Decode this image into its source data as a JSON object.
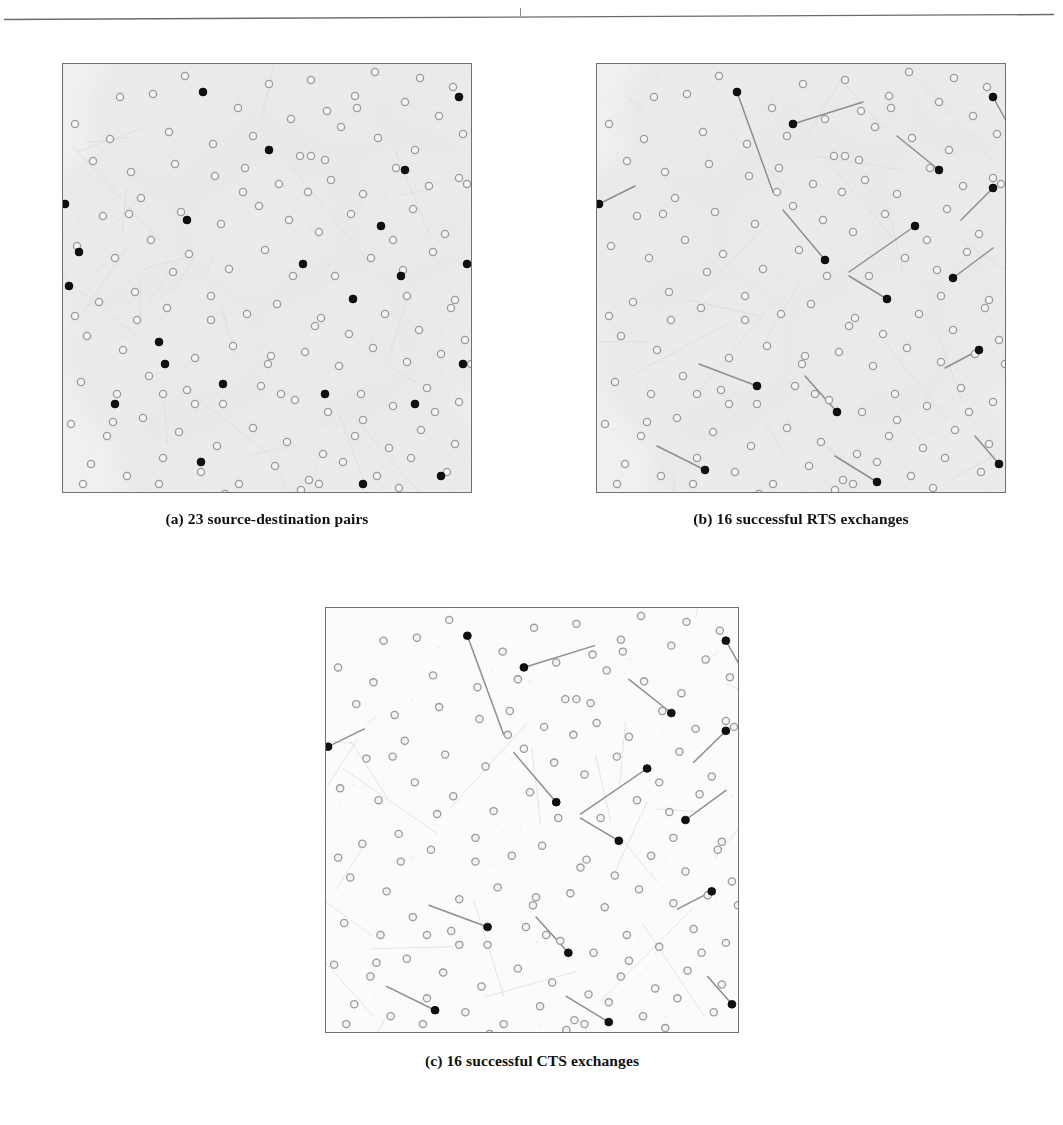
{
  "figure": {
    "header_rule": "horizontal-rule",
    "panels": [
      {
        "id": "a",
        "caption": "(a) 23 source-destination pairs",
        "label": "a",
        "background_shading": true,
        "links_drawn": false
      },
      {
        "id": "b",
        "caption": "(b) 16 successful RTS exchanges",
        "label": "b",
        "background_shading": true,
        "links_drawn": true
      },
      {
        "id": "c",
        "caption": "(c) 16 successful CTS exchanges",
        "label": "c",
        "background_shading": false,
        "links_drawn": true
      }
    ]
  },
  "colors": {
    "node_idle_stroke": "#9a9a9a",
    "node_idle_fill": "#f4f4f4",
    "node_active_fill": "#111111",
    "link_stroke": "#8e8e8e",
    "panel_border": "#70706e",
    "cell_shading": "#e8e8e8",
    "caption_text": "#111111",
    "page_background": "#ffffff"
  },
  "chart_data": {
    "type": "scatter",
    "title": "",
    "xlabel": "",
    "ylabel": "",
    "xlim": [
      0,
      410
    ],
    "ylim": [
      0,
      430
    ],
    "grid": false,
    "legend": null,
    "node_counts": {
      "total_nodes": 150,
      "active_nodes_panel_a": 23,
      "active_nodes_panel_b": 16,
      "active_nodes_panel_c": 16
    },
    "nodes": [
      [
        122,
        12
      ],
      [
        206,
        20
      ],
      [
        248,
        16
      ],
      [
        292,
        32
      ],
      [
        312,
        8
      ],
      [
        357,
        14
      ],
      [
        390,
        23
      ],
      [
        57,
        33
      ],
      [
        90,
        30
      ],
      [
        140,
        28
      ],
      [
        175,
        44
      ],
      [
        228,
        55
      ],
      [
        264,
        47
      ],
      [
        294,
        44
      ],
      [
        342,
        38
      ],
      [
        376,
        52
      ],
      [
        12,
        60
      ],
      [
        47,
        75
      ],
      [
        106,
        68
      ],
      [
        150,
        80
      ],
      [
        190,
        72
      ],
      [
        237,
        92
      ],
      [
        248,
        92
      ],
      [
        278,
        63
      ],
      [
        315,
        74
      ],
      [
        352,
        86
      ],
      [
        400,
        70
      ],
      [
        30,
        97
      ],
      [
        68,
        108
      ],
      [
        112,
        100
      ],
      [
        152,
        112
      ],
      [
        182,
        104
      ],
      [
        216,
        120
      ],
      [
        245,
        128
      ],
      [
        268,
        116
      ],
      [
        300,
        130
      ],
      [
        333,
        104
      ],
      [
        366,
        122
      ],
      [
        396,
        114
      ],
      [
        2,
        140
      ],
      [
        40,
        152
      ],
      [
        78,
        134
      ],
      [
        118,
        148
      ],
      [
        158,
        160
      ],
      [
        196,
        142
      ],
      [
        226,
        156
      ],
      [
        256,
        168
      ],
      [
        288,
        150
      ],
      [
        318,
        162
      ],
      [
        350,
        145
      ],
      [
        382,
        170
      ],
      [
        14,
        182
      ],
      [
        52,
        194
      ],
      [
        88,
        176
      ],
      [
        126,
        190
      ],
      [
        166,
        205
      ],
      [
        202,
        186
      ],
      [
        240,
        200
      ],
      [
        272,
        212
      ],
      [
        308,
        194
      ],
      [
        340,
        206
      ],
      [
        370,
        188
      ],
      [
        404,
        200
      ],
      [
        6,
        222
      ],
      [
        36,
        238
      ],
      [
        72,
        228
      ],
      [
        104,
        244
      ],
      [
        148,
        232
      ],
      [
        184,
        250
      ],
      [
        214,
        240
      ],
      [
        252,
        262
      ],
      [
        258,
        254
      ],
      [
        290,
        235
      ],
      [
        322,
        250
      ],
      [
        356,
        266
      ],
      [
        388,
        244
      ],
      [
        24,
        272
      ],
      [
        60,
        286
      ],
      [
        96,
        278
      ],
      [
        132,
        294
      ],
      [
        170,
        282
      ],
      [
        205,
        300
      ],
      [
        208,
        292
      ],
      [
        242,
        288
      ],
      [
        276,
        302
      ],
      [
        310,
        284
      ],
      [
        344,
        298
      ],
      [
        378,
        290
      ],
      [
        402,
        276
      ],
      [
        18,
        318
      ],
      [
        54,
        330
      ],
      [
        86,
        312
      ],
      [
        124,
        326
      ],
      [
        160,
        340
      ],
      [
        198,
        322
      ],
      [
        232,
        336
      ],
      [
        265,
        348
      ],
      [
        298,
        330
      ],
      [
        330,
        342
      ],
      [
        364,
        324
      ],
      [
        396,
        338
      ],
      [
        8,
        360
      ],
      [
        44,
        372
      ],
      [
        80,
        354
      ],
      [
        116,
        368
      ],
      [
        154,
        382
      ],
      [
        190,
        364
      ],
      [
        224,
        378
      ],
      [
        260,
        390
      ],
      [
        292,
        372
      ],
      [
        326,
        384
      ],
      [
        358,
        366
      ],
      [
        392,
        380
      ],
      [
        28,
        400
      ],
      [
        64,
        412
      ],
      [
        100,
        394
      ],
      [
        138,
        408
      ],
      [
        176,
        420
      ],
      [
        212,
        402
      ],
      [
        246,
        416
      ],
      [
        280,
        398
      ],
      [
        314,
        412
      ],
      [
        348,
        394
      ],
      [
        384,
        408
      ],
      [
        50,
        358
      ],
      [
        132,
        340
      ],
      [
        218,
        330
      ],
      [
        300,
        356
      ],
      [
        372,
        348
      ],
      [
        96,
        420
      ],
      [
        162,
        430
      ],
      [
        238,
        426
      ],
      [
        336,
        424
      ],
      [
        74,
        256
      ],
      [
        110,
        208
      ],
      [
        180,
        128
      ],
      [
        262,
        96
      ],
      [
        330,
        176
      ],
      [
        392,
        236
      ],
      [
        20,
        420
      ],
      [
        404,
        120
      ],
      [
        66,
        150
      ],
      [
        148,
        256
      ],
      [
        230,
        212
      ],
      [
        286,
        270
      ],
      [
        344,
        232
      ],
      [
        408,
        300
      ],
      [
        12,
        252
      ],
      [
        100,
        330
      ],
      [
        256,
        420
      ]
    ],
    "active_nodes_a": [
      [
        140,
        28
      ],
      [
        396,
        33
      ],
      [
        342,
        106
      ],
      [
        206,
        86
      ],
      [
        2,
        140
      ],
      [
        318,
        162
      ],
      [
        16,
        188
      ],
      [
        124,
        156
      ],
      [
        240,
        200
      ],
      [
        404,
        200
      ],
      [
        338,
        212
      ],
      [
        6,
        222
      ],
      [
        96,
        278
      ],
      [
        290,
        235
      ],
      [
        102,
        300
      ],
      [
        160,
        320
      ],
      [
        262,
        330
      ],
      [
        400,
        300
      ],
      [
        352,
        340
      ],
      [
        138,
        398
      ],
      [
        52,
        340
      ],
      [
        300,
        420
      ],
      [
        378,
        412
      ]
    ],
    "links_b": [
      {
        "from": [
          140,
          28
        ],
        "to": [
          176,
          128
        ]
      },
      {
        "from": [
          196,
          60
        ],
        "to": [
          266,
          38
        ]
      },
      {
        "from": [
          342,
          106
        ],
        "to": [
          300,
          72
        ]
      },
      {
        "from": [
          396,
          33
        ],
        "to": [
          412,
          62
        ]
      },
      {
        "from": [
          2,
          140
        ],
        "to": [
          38,
          122
        ]
      },
      {
        "from": [
          228,
          196
        ],
        "to": [
          186,
          146
        ]
      },
      {
        "from": [
          396,
          124
        ],
        "to": [
          364,
          156
        ]
      },
      {
        "from": [
          318,
          162
        ],
        "to": [
          252,
          208
        ]
      },
      {
        "from": [
          356,
          214
        ],
        "to": [
          396,
          184
        ]
      },
      {
        "from": [
          290,
          235
        ],
        "to": [
          252,
          212
        ]
      },
      {
        "from": [
          160,
          322
        ],
        "to": [
          102,
          300
        ]
      },
      {
        "from": [
          382,
          286
        ],
        "to": [
          348,
          304
        ]
      },
      {
        "from": [
          240,
          348
        ],
        "to": [
          208,
          312
        ]
      },
      {
        "from": [
          108,
          406
        ],
        "to": [
          60,
          382
        ]
      },
      {
        "from": [
          402,
          400
        ],
        "to": [
          378,
          372
        ]
      },
      {
        "from": [
          280,
          418
        ],
        "to": [
          238,
          392
        ]
      }
    ],
    "links_c": [
      {
        "from": [
          140,
          28
        ],
        "to": [
          176,
          128
        ]
      },
      {
        "from": [
          196,
          60
        ],
        "to": [
          266,
          38
        ]
      },
      {
        "from": [
          342,
          106
        ],
        "to": [
          300,
          72
        ]
      },
      {
        "from": [
          396,
          33
        ],
        "to": [
          412,
          62
        ]
      },
      {
        "from": [
          2,
          140
        ],
        "to": [
          38,
          122
        ]
      },
      {
        "from": [
          228,
          196
        ],
        "to": [
          186,
          146
        ]
      },
      {
        "from": [
          396,
          124
        ],
        "to": [
          364,
          156
        ]
      },
      {
        "from": [
          318,
          162
        ],
        "to": [
          252,
          208
        ]
      },
      {
        "from": [
          356,
          214
        ],
        "to": [
          396,
          184
        ]
      },
      {
        "from": [
          290,
          235
        ],
        "to": [
          252,
          212
        ]
      },
      {
        "from": [
          160,
          322
        ],
        "to": [
          102,
          300
        ]
      },
      {
        "from": [
          382,
          286
        ],
        "to": [
          348,
          304
        ]
      },
      {
        "from": [
          240,
          348
        ],
        "to": [
          208,
          312
        ]
      },
      {
        "from": [
          108,
          406
        ],
        "to": [
          60,
          382
        ]
      },
      {
        "from": [
          402,
          400
        ],
        "to": [
          378,
          372
        ]
      },
      {
        "from": [
          280,
          418
        ],
        "to": [
          238,
          392
        ]
      }
    ],
    "cells_a": [
      {
        "cx": 120,
        "cy": 60,
        "r": 95
      },
      {
        "cx": 258,
        "cy": 48,
        "r": 82
      },
      {
        "cx": 368,
        "cy": 40,
        "r": 70
      },
      {
        "cx": 60,
        "cy": 175,
        "r": 88
      },
      {
        "cx": 205,
        "cy": 150,
        "r": 110
      },
      {
        "cx": 348,
        "cy": 140,
        "r": 95
      },
      {
        "cx": 110,
        "cy": 290,
        "r": 105
      },
      {
        "cx": 270,
        "cy": 280,
        "r": 100
      },
      {
        "cx": 390,
        "cy": 250,
        "r": 78
      },
      {
        "cx": 150,
        "cy": 400,
        "r": 95
      },
      {
        "cx": 320,
        "cy": 395,
        "r": 95
      }
    ]
  }
}
